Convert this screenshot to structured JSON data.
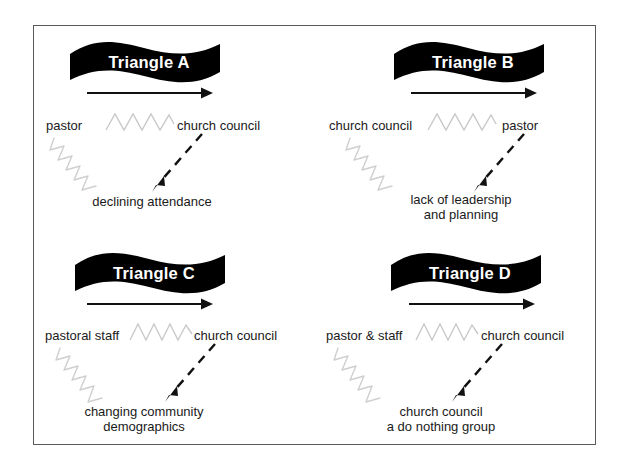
{
  "figure": {
    "border_color": "#5a5a5a",
    "banner_color": "#000000",
    "banner_text_color": "#ffffff",
    "squiggle_color": "#c9c9c9",
    "arrow_color": "#111111"
  },
  "panels": [
    {
      "id": "a",
      "banner_label": "Triangle A",
      "left_role": "pastor",
      "right_role": "church council",
      "outcome": "declining attendance"
    },
    {
      "id": "b",
      "banner_label": "Triangle B",
      "left_role": "church council",
      "right_role": "pastor",
      "outcome": "lack of leadership\nand planning"
    },
    {
      "id": "c",
      "banner_label": "Triangle C",
      "left_role": "pastoral staff",
      "right_role": "church council",
      "outcome": "changing community\ndemographics"
    },
    {
      "id": "d",
      "banner_label": "Triangle D",
      "left_role": "pastor & staff",
      "right_role": "church council",
      "outcome": "church council\na do nothing group"
    }
  ]
}
